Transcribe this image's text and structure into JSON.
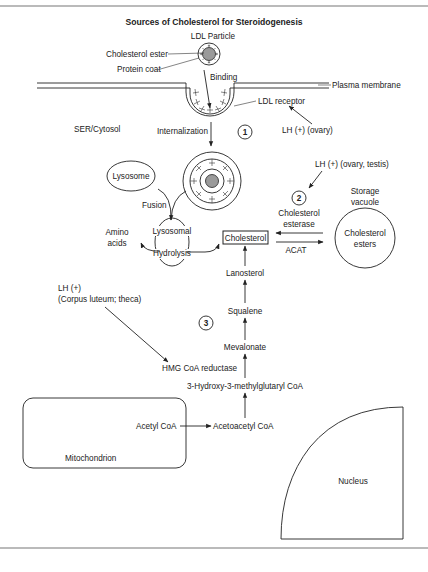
{
  "figure": {
    "title": "Sources of Cholesterol for Steroidogenesis",
    "border_color": "#777777",
    "core_fill": "#9a9a9a"
  },
  "ldl": {
    "particle_label": "LDL Particle",
    "cholesterol_ester_label": "Cholesterol ester",
    "protein_coat_label": "Protein coat",
    "binding_label": "Binding",
    "plasma_membrane_label": "Plasma membrane",
    "ldl_receptor_label": "LDL receptor",
    "lh_ovary_label": "LH (+) (ovary)",
    "compartment_label": "SER/Cytosol",
    "internalization_label": "Internalization",
    "step_1": "1"
  },
  "lysosome": {
    "lysosome_label": "Lysosome",
    "fusion_label": "Fusion",
    "lysosomal_label": "Lysosomal",
    "hydrolysis_label": "Hydrolysis",
    "amino_label": "Amino",
    "acids_label": "acids"
  },
  "storage": {
    "lh_label": "LH (+) (ovary, testis)",
    "step_2": "2",
    "esterase_line1": "Cholesterol",
    "esterase_line2": "esterase",
    "acat_label": "ACAT",
    "vacuole_line1": "Storage",
    "vacuole_line2": "vacuole",
    "esters_line1": "Cholesterol",
    "esters_line2": "esters"
  },
  "pathway": {
    "cholesterol": "Cholesterol",
    "lanosterol": "Lanosterol",
    "squalene": "Squalene",
    "mevalonate": "Mevalonate",
    "hmg_reductase": "HMG CoA reductase",
    "hmg_coa": "3-Hydroxy-3-methylglutaryl CoA",
    "acetoacetyl_coa": "Acetoacetyl CoA",
    "acetyl_coa": "Acetyl CoA",
    "step_3": "3",
    "lh_line1": "LH (+)",
    "lh_line2": "(Corpus luteum; theca)"
  },
  "organelles": {
    "mitochondrion": "Mitochondrion",
    "nucleus": "Nucleus"
  }
}
